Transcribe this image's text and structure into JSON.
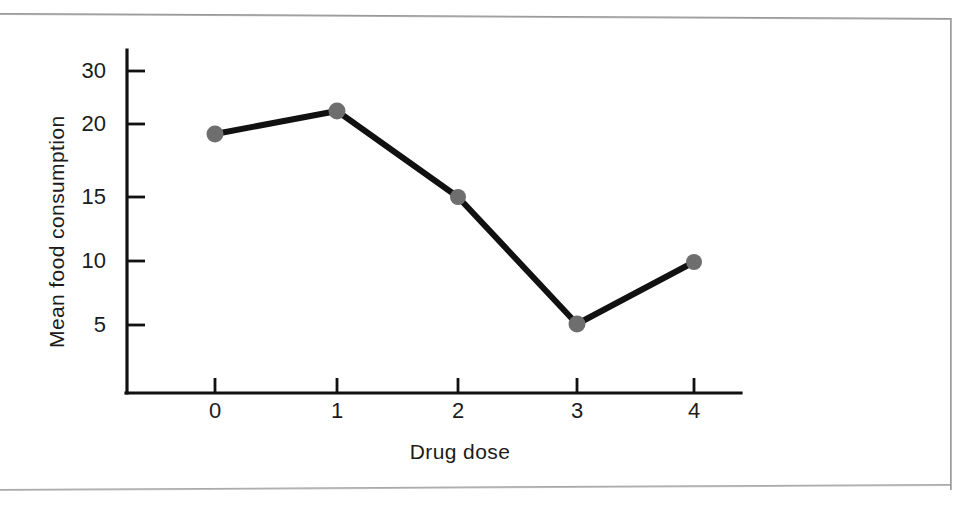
{
  "figure": {
    "background_color": "#ffffff",
    "frame_color": "#9a9a9a",
    "axis_color": "#111111",
    "line_color": "#111111",
    "marker_color": "#6e6e6e"
  },
  "chart_data": {
    "type": "line",
    "title": "",
    "subtitle": "",
    "xlabel": "Drug dose",
    "ylabel": "Mean food consumption",
    "x": [
      0,
      1,
      2,
      3,
      4
    ],
    "categories": [
      "0",
      "1",
      "2",
      "3",
      "4"
    ],
    "values": [
      20,
      21.8,
      15,
      5,
      9.8
    ],
    "series": [
      {
        "name": "Mean food consumption",
        "values": [
          20,
          21.8,
          15,
          5,
          9.8
        ],
        "marker": "circle",
        "marker_color": "#6e6e6e",
        "line_color": "#111111"
      }
    ],
    "xlim": [
      -0.6,
      4.85
    ],
    "ylim": [
      0,
      32
    ],
    "xticks": [
      0,
      1,
      2,
      3,
      4
    ],
    "xtick_labels": [
      "0",
      "1",
      "2",
      "3",
      "4"
    ],
    "yticks": [
      5,
      10,
      15,
      20,
      30
    ],
    "ytick_labels": [
      "5",
      "10",
      "15",
      "20",
      "30"
    ],
    "grid": false,
    "legend": false,
    "legend_position": "none",
    "annotations": []
  },
  "axes": {
    "x_label": "Drug dose",
    "y_label": "Mean food consumption",
    "y_ticks": [
      {
        "label": "30",
        "value": 30
      },
      {
        "label": "20",
        "value": 20
      },
      {
        "label": "15",
        "value": 15
      },
      {
        "label": "10",
        "value": 10
      },
      {
        "label": "5",
        "value": 5
      }
    ],
    "x_ticks": [
      {
        "label": "0",
        "value": 0
      },
      {
        "label": "1",
        "value": 1
      },
      {
        "label": "2",
        "value": 2
      },
      {
        "label": "3",
        "value": 3
      },
      {
        "label": "4",
        "value": 4
      }
    ]
  },
  "points": [
    {
      "label": "0",
      "x": 0,
      "y": 20,
      "px": 215,
      "py": 134
    },
    {
      "label": "1",
      "x": 1,
      "y": 21.8,
      "px": 337,
      "py": 111
    },
    {
      "label": "2",
      "x": 2,
      "y": 15,
      "px": 458,
      "py": 197
    },
    {
      "label": "3",
      "x": 3,
      "y": 5,
      "px": 577,
      "py": 324
    },
    {
      "label": "4",
      "x": 4,
      "y": 9.8,
      "px": 694,
      "py": 262
    }
  ]
}
